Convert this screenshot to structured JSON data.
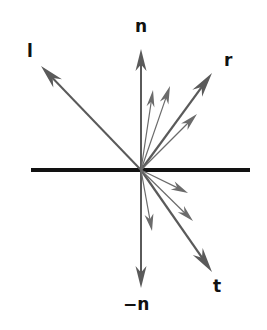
{
  "figure": {
    "background_color": "#ffffff",
    "width": 267,
    "height": 330
  },
  "surface_line": {
    "name": "interface-surface-line",
    "x1": 31,
    "y1": 170,
    "x2": 250,
    "y2": 170,
    "color": "#121212",
    "stroke_width": 4
  },
  "origin": {
    "x": 141,
    "y": 170
  },
  "colors": {
    "arrow_gray": "#6b6b6b",
    "arrow_gray_dark": "#5a5a5a",
    "label_text": "#111111",
    "surface_black": "#121212",
    "background": "#ffffff"
  },
  "labels": [
    {
      "id": "n",
      "text": "n",
      "x": 141,
      "y": 27
    },
    {
      "id": "neg-n",
      "text": "−n",
      "x": 141,
      "y": 305
    },
    {
      "id": "l",
      "text": "l",
      "x": 31,
      "y": 52
    },
    {
      "id": "r",
      "text": "r",
      "x": 229,
      "y": 62
    },
    {
      "id": "t",
      "text": "t",
      "x": 219,
      "y": 287
    }
  ],
  "vectors": [
    {
      "id": "normal-n",
      "label": "n",
      "tip_x": 141,
      "tip_y": 49,
      "stroke_width": 2.0,
      "head_length": 22,
      "head_width": 11,
      "major": true
    },
    {
      "id": "negative-normal-n",
      "label": "−n",
      "tip_x": 141,
      "tip_y": 288,
      "stroke_width": 2.0,
      "head_length": 22,
      "head_width": 11,
      "major": true
    },
    {
      "id": "incident-light-l",
      "label": "l",
      "tip_x": 41,
      "tip_y": 66,
      "stroke_width": 2.0,
      "head_length": 24,
      "head_width": 12,
      "major": true
    },
    {
      "id": "reflected-r",
      "label": "r",
      "tip_x": 212,
      "tip_y": 73,
      "stroke_width": 2.2,
      "head_length": 25,
      "head_width": 12,
      "major": true
    },
    {
      "id": "transmitted-t",
      "label": "t",
      "tip_x": 212,
      "tip_y": 272,
      "stroke_width": 2.2,
      "head_length": 25,
      "head_width": 12,
      "major": true
    },
    {
      "id": "reflection-lobe-1",
      "label": "",
      "tip_x": 153,
      "tip_y": 90,
      "stroke_width": 1.2,
      "head_length": 17,
      "head_width": 8,
      "major": false
    },
    {
      "id": "reflection-lobe-2",
      "label": "",
      "tip_x": 170,
      "tip_y": 86,
      "stroke_width": 1.2,
      "head_length": 18,
      "head_width": 9,
      "major": false
    },
    {
      "id": "reflection-lobe-3",
      "label": "",
      "tip_x": 197,
      "tip_y": 114,
      "stroke_width": 1.2,
      "head_length": 18,
      "head_width": 9,
      "major": false
    },
    {
      "id": "transmission-lobe-1",
      "label": "",
      "tip_x": 188,
      "tip_y": 193,
      "stroke_width": 1.2,
      "head_length": 17,
      "head_width": 9,
      "major": false
    },
    {
      "id": "transmission-lobe-2",
      "label": "",
      "tip_x": 193,
      "tip_y": 221,
      "stroke_width": 1.2,
      "head_length": 17,
      "head_width": 9,
      "major": false
    },
    {
      "id": "transmission-lobe-3",
      "label": "",
      "tip_x": 152,
      "tip_y": 231,
      "stroke_width": 1.2,
      "head_length": 17,
      "head_width": 9,
      "major": false
    }
  ]
}
